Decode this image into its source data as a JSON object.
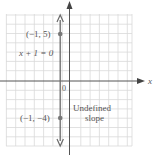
{
  "graph": {
    "x_axis_label": "x",
    "y_axis_label": "y",
    "origin_label": "0",
    "equation": "x + 1 = 0",
    "line": {
      "x": -1,
      "type": "vertical"
    },
    "points": [
      {
        "label": "(−1, 5)",
        "x": -1,
        "y": 5
      },
      {
        "label": "(−1, −4)",
        "x": -1,
        "y": -4
      }
    ],
    "annotation_line1": "Undefined",
    "annotation_line2": "slope",
    "colors": {
      "grid": "#d6d6d6",
      "axis": "#555555",
      "line": "#6a6a6a",
      "point": "#777777",
      "text": "#555555"
    }
  }
}
